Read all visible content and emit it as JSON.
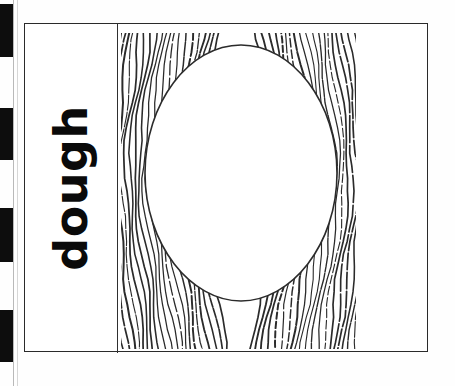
{
  "page": {
    "type": "scanned-flashcard",
    "background_color": "#ffffff",
    "ink_color": "#111111"
  },
  "timing_strip": {
    "name": "scan-timing-marks",
    "mark_color": "#0d0d0d",
    "gap_color": "#ffffff",
    "strip_width_px": 13,
    "marks": [
      {
        "top": 4,
        "height": 53
      },
      {
        "top": 108,
        "height": 52
      },
      {
        "top": 208,
        "height": 54
      },
      {
        "top": 310,
        "height": 52
      }
    ]
  },
  "card": {
    "frame": {
      "name": "card-border",
      "left": 24,
      "top": 23,
      "width": 404,
      "height": 329,
      "border_color": "#2a2a2a"
    },
    "divider": {
      "name": "vertical-divider",
      "x": 117,
      "color": "#2f2f2f"
    },
    "word_panel": {
      "label": "dough",
      "rotation_degrees": 180,
      "orientation": "vertical-rotated",
      "font_weight": "bold",
      "color": "#0a0a0a"
    },
    "illustration": {
      "name": "wood-grain-oval-illustration",
      "description": "wood grain lines surrounding blank oval",
      "left": 121,
      "top": 33,
      "width": 235,
      "height": 316,
      "line_color": "#2b2b2b",
      "oval": {
        "center_x": 120,
        "center_y": 140,
        "radius_x": 96,
        "radius_y": 128,
        "fill": "#ffffff"
      }
    }
  }
}
